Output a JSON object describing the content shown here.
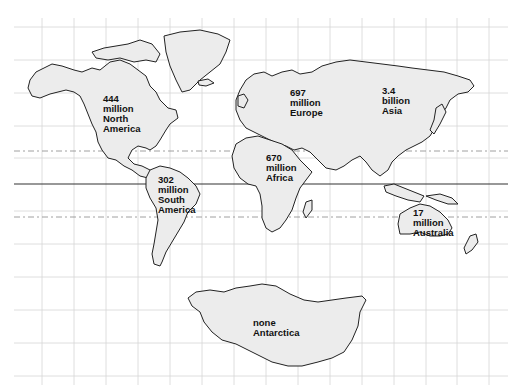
{
  "map": {
    "title": "World population by continent",
    "colors": {
      "land": "#ececec",
      "outline": "#222222",
      "grid": "#d6d6d6",
      "background": "#ffffff"
    },
    "continents": [
      {
        "id": "north-america",
        "lines": [
          "444",
          "million",
          "North",
          "America"
        ]
      },
      {
        "id": "south-america",
        "lines": [
          "302",
          "million",
          "South",
          "America"
        ]
      },
      {
        "id": "europe",
        "lines": [
          "697",
          "million",
          "Europe"
        ]
      },
      {
        "id": "asia",
        "lines": [
          "3.4",
          "billion",
          "Asia"
        ]
      },
      {
        "id": "africa",
        "lines": [
          "670",
          "million",
          "Africa"
        ]
      },
      {
        "id": "australia",
        "lines": [
          "17",
          "million",
          "Australia"
        ]
      },
      {
        "id": "antarctica",
        "lines": [
          "none",
          "Antarctica"
        ]
      }
    ]
  }
}
